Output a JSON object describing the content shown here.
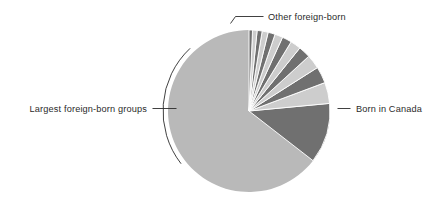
{
  "figure": {
    "background": "#ffffff",
    "width": 447,
    "height": 202
  },
  "chart_data": {
    "type": "pie",
    "title": "",
    "subtitle": "",
    "xlabel": "",
    "ylabel": "",
    "legend_position": "none",
    "grid": false,
    "start_angle_deg": -90,
    "direction": "counterclockwise",
    "center": {
      "x": 249,
      "y": 111
    },
    "radius": 81,
    "categories": [
      "Born in Canada",
      "Other foreign-born",
      "Largest foreign-born group 1",
      "Largest foreign-born group 2",
      "Largest foreign-born group 3",
      "Largest foreign-born group 4",
      "Largest foreign-born group 5",
      "Largest foreign-born group 6",
      "Largest foreign-born group 7",
      "Largest foreign-born group 8",
      "Largest foreign-born group 9",
      "Largest foreign-born group 10",
      "Largest foreign-born group 11",
      "Largest foreign-born group 12"
    ],
    "values": [
      64.5,
      12.0,
      4.2,
      3.3,
      2.8,
      2.4,
      2.1,
      1.9,
      1.6,
      1.4,
      1.2,
      1.0,
      0.9,
      0.7
    ],
    "slice_colors": [
      "#b9b9b9",
      "#707070",
      "#cdcdcd",
      "#707070",
      "#cdcdcd",
      "#707070",
      "#cdcdcd",
      "#707070",
      "#cdcdcd",
      "#707070",
      "#cdcdcd",
      "#707070",
      "#cdcdcd",
      "#707070"
    ],
    "groups": [
      {
        "name": "Born in Canada",
        "share": 64.5,
        "color": "#b9b9b9"
      },
      {
        "name": "Other foreign-born",
        "share": 12.0,
        "color": "#707070"
      },
      {
        "name": "Largest foreign-born groups",
        "share": 23.5,
        "color": "#9d9d9d",
        "slice_count": 12
      }
    ]
  },
  "annotations": {
    "other_foreign_born": {
      "label": "Other foreign-born",
      "position": "top"
    },
    "largest_groups": {
      "label": "Largest foreign-born groups",
      "position": "left"
    },
    "born_in_canada": {
      "label": "Born in Canada",
      "position": "right"
    }
  },
  "colors": {
    "born_in_canada": "#b9b9b9",
    "other_foreign_born": "#707070",
    "group_light": "#cdcdcd",
    "group_dark": "#707070",
    "text": "#2b2b2b",
    "leader_line": "#2b2b2b",
    "bracket": "#2b2b2b"
  }
}
